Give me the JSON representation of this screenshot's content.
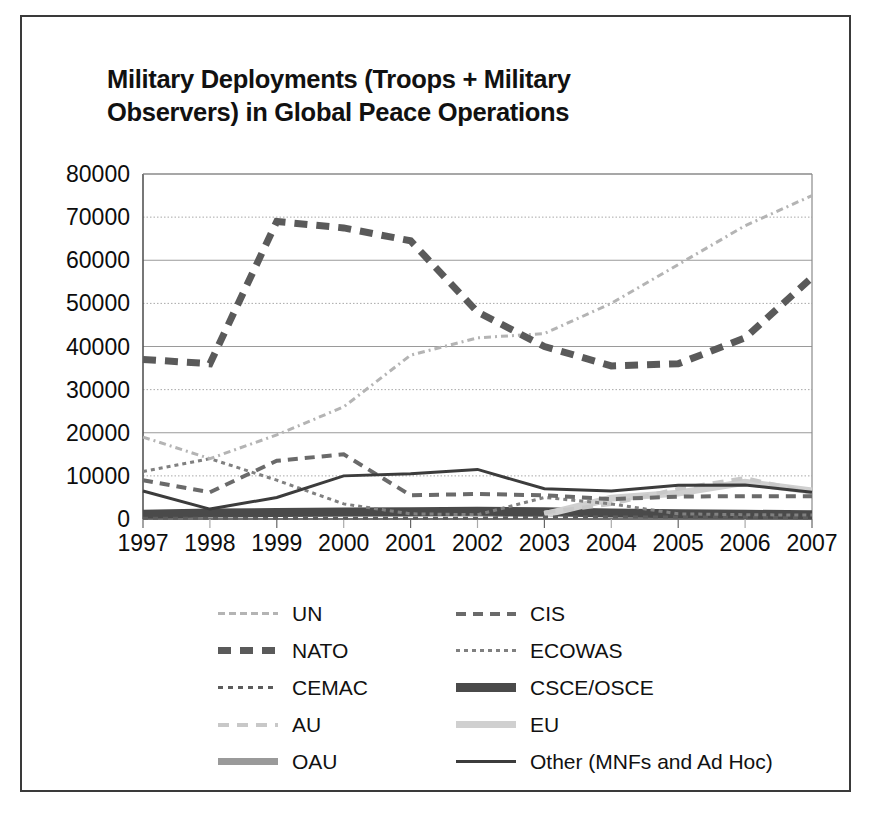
{
  "title": "Military Deployments (Troops + Military Observers) in Global Peace Operations",
  "title_line1": "Military Deployments (Troops + Military",
  "title_line2": "Observers) in Global Peace Operations",
  "axis": {
    "yticks": [
      "80000",
      "70000",
      "60000",
      "50000",
      "40000",
      "30000",
      "20000",
      "10000",
      "0"
    ],
    "xticks": [
      "1997",
      "1998",
      "1999",
      "2000",
      "2001",
      "2002",
      "2003",
      "2004",
      "2005",
      "2006",
      "2007"
    ]
  },
  "legend": {
    "left": [
      {
        "label": "UN",
        "key": "UN"
      },
      {
        "label": "NATO",
        "key": "NATO"
      },
      {
        "label": "CEMAC",
        "key": "CEMAC"
      },
      {
        "label": "AU",
        "key": "AU"
      },
      {
        "label": "OAU",
        "key": "OAU"
      }
    ],
    "right": [
      {
        "label": "CIS",
        "key": "CIS"
      },
      {
        "label": "ECOWAS",
        "key": "ECOWAS"
      },
      {
        "label": "CSCE/OSCE",
        "key": "CSCE/OSCE"
      },
      {
        "label": "EU",
        "key": "EU"
      },
      {
        "label": "Other (MNFs and Ad Hoc)",
        "key": "Other"
      }
    ]
  },
  "chart_data": {
    "type": "line",
    "title": "Military Deployments (Troops + Military Observers) in Global Peace Operations",
    "xlabel": "",
    "ylabel": "",
    "x": [
      1997,
      1998,
      1999,
      2000,
      2001,
      2002,
      2003,
      2004,
      2005,
      2006,
      2007
    ],
    "categories": [
      "1997",
      "1998",
      "1999",
      "2000",
      "2001",
      "2002",
      "2003",
      "2004",
      "2005",
      "2006",
      "2007"
    ],
    "ylim": [
      0,
      80000
    ],
    "xlim": [
      1997,
      2007
    ],
    "grid": true,
    "legend_position": "bottom",
    "series": [
      {
        "name": "UN",
        "color": "#b4b4b4",
        "style": "dash-dot",
        "width": 3,
        "values": [
          19000,
          14000,
          19500,
          26000,
          38000,
          42000,
          43000,
          50000,
          59000,
          68000,
          75000
        ]
      },
      {
        "name": "NATO",
        "color": "#5a5a5a",
        "style": "dashed-heavy",
        "width": 7,
        "values": [
          37000,
          36000,
          69000,
          67500,
          64500,
          48000,
          40000,
          35500,
          36000,
          42000,
          56000
        ]
      },
      {
        "name": "CEMAC",
        "color": "#5c5c5c",
        "style": "short-dash",
        "width": 3,
        "values": [
          200,
          200,
          200,
          200,
          200,
          200,
          450,
          450,
          450,
          450,
          200
        ]
      },
      {
        "name": "AU",
        "color": "#c8c8c8",
        "style": "dash-long",
        "width": 4,
        "values": [
          0,
          0,
          0,
          0,
          0,
          0,
          1500,
          3500,
          7000,
          9500,
          6000
        ]
      },
      {
        "name": "OAU",
        "color": "#9a9a9a",
        "style": "solid-heavy",
        "width": 7,
        "values": [
          1000,
          1200,
          1300,
          1400,
          1400,
          1400,
          1200,
          0,
          0,
          0,
          0
        ]
      },
      {
        "name": "CIS",
        "color": "#6a6a6a",
        "style": "medium-dash",
        "width": 4,
        "values": [
          9000,
          6200,
          13500,
          15000,
          5500,
          5800,
          5500,
          4600,
          5200,
          5300,
          5300
        ]
      },
      {
        "name": "ECOWAS",
        "color": "#808080",
        "style": "fine-dash",
        "width": 3,
        "values": [
          11000,
          14000,
          9000,
          3500,
          1200,
          1000,
          5000,
          3500,
          1200,
          1000,
          900
        ]
      },
      {
        "name": "CSCE/OSCE",
        "color": "#4a4a4a",
        "style": "solid-extra-heavy",
        "width": 9,
        "values": [
          1100,
          1400,
          1500,
          1600,
          1700,
          1800,
          1700,
          1400,
          1200,
          1100,
          1000
        ]
      },
      {
        "name": "EU",
        "color": "#d0d0d0",
        "style": "solid-heavy-light",
        "width": 7,
        "values": [
          0,
          0,
          0,
          0,
          0,
          0,
          1000,
          4800,
          6000,
          8500,
          6500
        ]
      },
      {
        "name": "Other (MNFs and Ad Hoc)",
        "color": "#3c3c3c",
        "style": "solid-thin",
        "width": 3,
        "values": [
          6500,
          2300,
          5000,
          10000,
          10500,
          11500,
          7000,
          6500,
          7800,
          7900,
          6200
        ]
      }
    ]
  }
}
